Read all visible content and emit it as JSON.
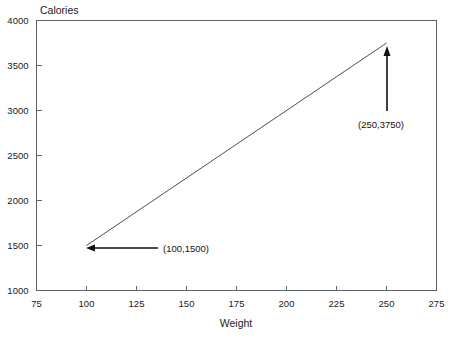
{
  "chart_data": {
    "type": "line",
    "title": "",
    "xlabel": "Weight",
    "ylabel": "Calories",
    "ylabel_position": "top-left",
    "xlim": [
      75,
      275
    ],
    "ylim": [
      1000,
      4000
    ],
    "grid": false,
    "legend": "none",
    "x": [
      100,
      250
    ],
    "series": [
      {
        "name": "calories-vs-weight",
        "values": [
          1500,
          3750
        ]
      }
    ],
    "xticks": [
      75,
      100,
      125,
      150,
      175,
      200,
      225,
      250,
      275
    ],
    "xtick_labels": [
      "75",
      "100",
      "125",
      "150",
      "175",
      "200",
      "225",
      "250",
      "275"
    ],
    "yticks": [
      1000,
      1500,
      2000,
      2500,
      3000,
      3500,
      4000
    ],
    "ytick_labels": [
      "1000",
      "1500",
      "2000",
      "2500",
      "3000",
      "3500",
      "4000"
    ],
    "annotations": [
      {
        "name": "start-point-annotation",
        "text": "(100,1500)",
        "point": [
          100,
          1500
        ],
        "arrow_direction": "left"
      },
      {
        "name": "end-point-annotation",
        "text": "(250,3750)",
        "point": [
          250,
          3750
        ],
        "arrow_direction": "up"
      }
    ]
  },
  "colors": {
    "line": "#3a3a3a",
    "frame": "#5f6368",
    "text": "#1a1a1a",
    "annotation": "#111111",
    "background": "#ffffff"
  }
}
